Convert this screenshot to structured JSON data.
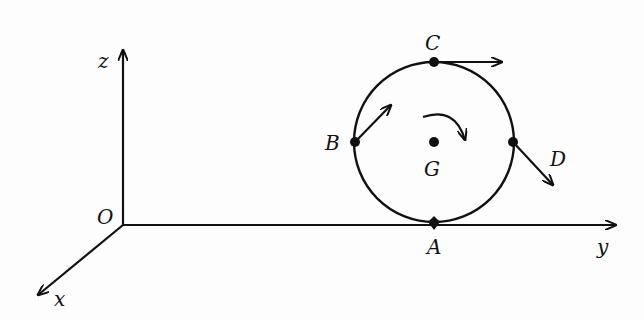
{
  "diagram": {
    "type": "rolling-disk-velocity-diagram",
    "axes": {
      "origin_label": "O",
      "x_label": "x",
      "y_label": "y",
      "z_label": "z"
    },
    "disk": {
      "center_label": "G",
      "rotation": "clockwise",
      "points": [
        {
          "label": "A",
          "position": "bottom (contact point)"
        },
        {
          "label": "B",
          "position": "left"
        },
        {
          "label": "C",
          "position": "top"
        },
        {
          "label": "D",
          "position": "right"
        }
      ],
      "velocity_arrows": [
        {
          "at": "B",
          "direction": "up-right"
        },
        {
          "at": "C",
          "direction": "right"
        },
        {
          "at": "D",
          "direction": "down-right"
        }
      ]
    },
    "colors": {
      "ink": "#111111",
      "background": "#fdfdfd"
    }
  }
}
